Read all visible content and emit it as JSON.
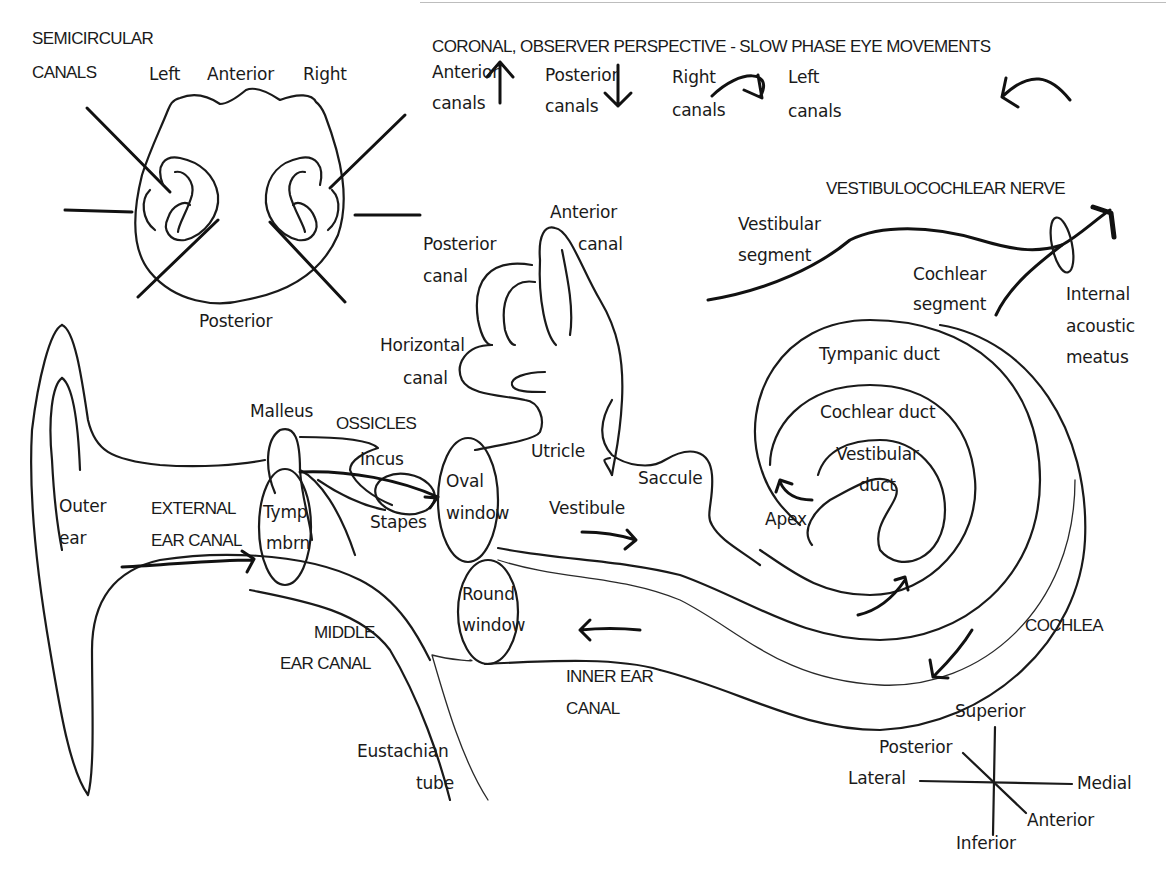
{
  "diagram": {
    "colors": {
      "ink": "#1a1a1a",
      "background": "#ffffff"
    },
    "semicircular_canals": {
      "title_line1": "SEMICIRCULAR",
      "title_line2": "CANALS",
      "left": "Left",
      "anterior": "Anterior",
      "right": "Right",
      "posterior": "Posterior"
    },
    "eye_movements": {
      "title": "CORONAL, OBSERVER PERSPECTIVE - SLOW PHASE EYE MOVEMENTS",
      "items": [
        {
          "line1": "Anterior",
          "line2": "canals",
          "arrow": "up-arrow"
        },
        {
          "line1": "Posterior",
          "line2": "canals",
          "arrow": "down-arrow"
        },
        {
          "line1": "Right",
          "line2": "canals",
          "arrow": "clockwise-arrow"
        },
        {
          "line1": "Left",
          "line2": "canals",
          "arrow": "counterclockwise-arrow"
        }
      ]
    },
    "nerve": {
      "title": "VESTIBULOCOCHLEAR NERVE",
      "vestibular_line1": "Vestibular",
      "vestibular_line2": "segment",
      "cochlear_line1": "Cochlear",
      "cochlear_line2": "segment",
      "meatus_line1": "Internal",
      "meatus_line2": "acoustic",
      "meatus_line3": "meatus"
    },
    "labyrinth": {
      "anterior_canal_line1": "Anterior",
      "anterior_canal_line2": "canal",
      "posterior_canal_line1": "Posterior",
      "posterior_canal_line2": "canal",
      "horizontal_canal_line1": "Horizontal",
      "horizontal_canal_line2": "canal",
      "utricle": "Utricle",
      "saccule": "Saccule",
      "vestibule": "Vestibule"
    },
    "outer_ear": {
      "outer_line1": "Outer",
      "outer_line2": "ear",
      "ext_line1": "EXTERNAL",
      "ext_line2": "EAR CANAL"
    },
    "middle_ear": {
      "malleus": "Malleus",
      "ossicles": "OSSICLES",
      "incus": "Incus",
      "stapes": "Stapes",
      "tymp_line1": "Tymp",
      "tymp_line2": "mbrn",
      "oval_line1": "Oval",
      "oval_line2": "window",
      "round_line1": "Round",
      "round_line2": "window",
      "middle_line1": "MIDDLE",
      "middle_line2": "EAR CANAL",
      "eust_line1": "Eustachian",
      "eust_line2": "tube"
    },
    "inner_ear": {
      "inner_line1": "INNER EAR",
      "inner_line2": "CANAL",
      "cochlea": "COCHLEA",
      "tympanic_duct": "Tympanic duct",
      "cochlear_duct": "Cochlear duct",
      "vestibular_duct_line1": "Vestibular",
      "vestibular_duct_line2": "duct",
      "apex": "Apex"
    },
    "compass": {
      "superior": "Superior",
      "inferior": "Inferior",
      "lateral": "Lateral",
      "medial": "Medial",
      "posterior": "Posterior",
      "anterior": "Anterior"
    }
  }
}
